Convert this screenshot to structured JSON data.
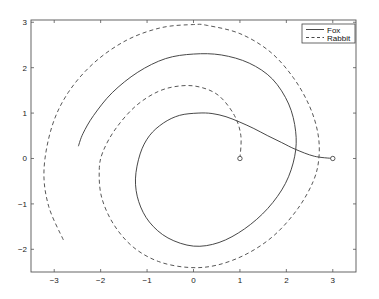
{
  "chart_data": {
    "type": "line",
    "title": "",
    "xlabel": "",
    "ylabel": "",
    "xlim": [
      -3.5,
      3.5
    ],
    "ylim": [
      -2.5,
      3.05
    ],
    "xticks": [
      -3,
      -2,
      -1,
      0,
      1,
      2,
      3
    ],
    "yticks": [
      -2,
      -1,
      0,
      1,
      2,
      3
    ],
    "xtick_labels": [
      "−3",
      "−2",
      "−1",
      "0",
      "1",
      "2",
      "3"
    ],
    "ytick_labels": [
      "−2",
      "−1",
      "0",
      "1",
      "2",
      "3"
    ],
    "grid": false,
    "legend_position": "upper right",
    "series": [
      {
        "name": "Fox",
        "style": "solid",
        "color": "#333333",
        "points": [
          [
            3.0,
            0.0
          ],
          [
            2.6,
            0.05
          ],
          [
            2.2,
            0.2
          ],
          [
            1.9,
            0.35
          ],
          [
            1.6,
            0.5
          ],
          [
            1.3,
            0.66
          ],
          [
            1.0,
            0.8
          ],
          [
            0.7,
            0.92
          ],
          [
            0.4,
            0.99
          ],
          [
            0.1,
            1.0
          ],
          [
            -0.3,
            0.95
          ],
          [
            -0.65,
            0.78
          ],
          [
            -0.95,
            0.5
          ],
          [
            -1.15,
            0.1
          ],
          [
            -1.25,
            -0.45
          ],
          [
            -1.18,
            -0.95
          ],
          [
            -0.95,
            -1.4
          ],
          [
            -0.55,
            -1.75
          ],
          [
            0.0,
            -1.93
          ],
          [
            0.55,
            -1.85
          ],
          [
            1.1,
            -1.55
          ],
          [
            1.6,
            -1.1
          ],
          [
            1.98,
            -0.55
          ],
          [
            2.18,
            0.05
          ],
          [
            2.2,
            0.6
          ],
          [
            2.05,
            1.2
          ],
          [
            1.7,
            1.75
          ],
          [
            1.2,
            2.1
          ],
          [
            0.6,
            2.28
          ],
          [
            0.0,
            2.3
          ],
          [
            -0.6,
            2.2
          ],
          [
            -1.2,
            1.9
          ],
          [
            -1.75,
            1.45
          ],
          [
            -2.15,
            0.95
          ],
          [
            -2.38,
            0.55
          ],
          [
            -2.48,
            0.27
          ]
        ],
        "start_marker": [
          3.0,
          0.0
        ]
      },
      {
        "name": "Rabbit",
        "style": "dashed",
        "color": "#333333",
        "points": [
          [
            1.0,
            0.0
          ],
          [
            1.02,
            0.5
          ],
          [
            0.88,
            0.95
          ],
          [
            0.55,
            1.38
          ],
          [
            0.15,
            1.57
          ],
          [
            -0.27,
            1.6
          ],
          [
            -0.75,
            1.48
          ],
          [
            -1.25,
            1.15
          ],
          [
            -1.68,
            0.65
          ],
          [
            -1.95,
            0.15
          ],
          [
            -2.03,
            -0.25
          ],
          [
            -1.98,
            -0.85
          ],
          [
            -1.72,
            -1.45
          ],
          [
            -1.3,
            -1.95
          ],
          [
            -0.75,
            -2.27
          ],
          [
            -0.1,
            -2.4
          ],
          [
            0.5,
            -2.35
          ],
          [
            1.15,
            -2.1
          ],
          [
            1.75,
            -1.68
          ],
          [
            2.25,
            -1.1
          ],
          [
            2.58,
            -0.5
          ],
          [
            2.7,
            0.0
          ],
          [
            2.68,
            0.55
          ],
          [
            2.5,
            1.15
          ],
          [
            2.15,
            1.78
          ],
          [
            1.65,
            2.35
          ],
          [
            1.0,
            2.75
          ],
          [
            0.3,
            2.93
          ],
          [
            0.0,
            2.95
          ],
          [
            -0.7,
            2.88
          ],
          [
            -1.45,
            2.6
          ],
          [
            -2.15,
            2.1
          ],
          [
            -2.7,
            1.45
          ],
          [
            -3.05,
            0.7
          ],
          [
            -3.22,
            -0.25
          ],
          [
            -3.12,
            -1.05
          ],
          [
            -2.8,
            -1.8
          ]
        ],
        "start_marker": [
          1.0,
          0.0
        ]
      }
    ],
    "legend": [
      {
        "label": "Fox",
        "style": "solid"
      },
      {
        "label": "Rabbit",
        "style": "dashed"
      }
    ]
  }
}
